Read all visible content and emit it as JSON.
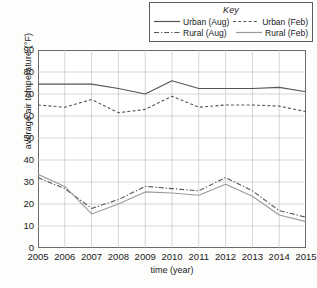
{
  "legend": {
    "title": "Key",
    "entries": [
      {
        "label": "Urban (Aug)",
        "style": "solid",
        "color": "#555555"
      },
      {
        "label": "Urban (Feb)",
        "style": "dashed",
        "color": "#555555"
      },
      {
        "label": "Rural (Aug)",
        "style": "dashdot",
        "color": "#555555"
      },
      {
        "label": "Rural (Feb)",
        "style": "solid",
        "color": "#9a9a9a"
      }
    ]
  },
  "chart_data": {
    "type": "line",
    "title": "",
    "xlabel": "time (year)",
    "ylabel": "average air temperature (°F)",
    "x": [
      2005,
      2006,
      2007,
      2008,
      2009,
      2010,
      2011,
      2012,
      2013,
      2014,
      2015
    ],
    "categories": [
      "2005",
      "2006",
      "2007",
      "2008",
      "2009",
      "2010",
      "2011",
      "2012",
      "2013",
      "2014",
      "2015"
    ],
    "xlim": [
      2005,
      2015
    ],
    "ylim": [
      0,
      90
    ],
    "yticks": [
      0,
      10,
      20,
      30,
      40,
      50,
      60,
      70,
      80,
      90
    ],
    "ytick_labels": [
      "0",
      "10",
      "20",
      "30",
      "40",
      "50",
      "60",
      "70",
      "80",
      "90"
    ],
    "grid": true,
    "legend_position": "top",
    "series": [
      {
        "name": "Urban (Aug)",
        "style": "solid",
        "color": "#555555",
        "values": [
          74.5,
          74.5,
          74.5,
          72.5,
          70,
          76,
          72.5,
          72.5,
          72.5,
          73,
          71
        ]
      },
      {
        "name": "Urban (Feb)",
        "style": "dashed",
        "color": "#555555",
        "values": [
          65,
          64,
          67.5,
          61.5,
          63,
          69,
          64,
          65,
          65,
          64.5,
          62
        ]
      },
      {
        "name": "Rural (Aug)",
        "style": "dashdot",
        "color": "#555555",
        "values": [
          32,
          27,
          18,
          22,
          28,
          27,
          26,
          32,
          26,
          17,
          14
        ]
      },
      {
        "name": "Rural (Feb)",
        "style": "solid",
        "color": "#9a9a9a",
        "values": [
          33.5,
          28,
          15.5,
          20,
          25.5,
          25,
          24,
          29,
          23.5,
          15,
          12
        ]
      }
    ]
  }
}
